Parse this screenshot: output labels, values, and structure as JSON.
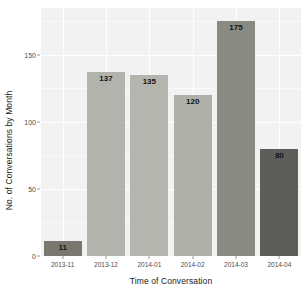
{
  "chart_data": {
    "type": "bar",
    "title": "",
    "subtitle": "",
    "xlabel": "Time of Conversation",
    "ylabel": "No. of Conversations by Month",
    "categories": [
      "2013-11",
      "2013-12",
      "2014-01",
      "2014-02",
      "2014-03",
      "2014-04"
    ],
    "values": [
      11,
      137,
      135,
      120,
      175,
      80
    ],
    "data_labels": [
      "11",
      "137",
      "135",
      "120",
      "175",
      "80"
    ],
    "bar_colors": [
      "#77776f",
      "#b3b3ad",
      "#b5b5af",
      "#b0b0aa",
      "#8a8a84",
      "#5d5d5a"
    ],
    "ylim": [
      0,
      185
    ],
    "y_ticks": [
      0,
      50,
      100,
      150
    ],
    "y_tick_labels": [
      "0",
      "50",
      "100",
      "150"
    ],
    "y_minor_ticks": [
      25,
      75,
      125,
      175
    ],
    "grid": true,
    "legend": "none",
    "panel_background": "#f2f2f2",
    "gridline_color": "#ffffff",
    "text_color": "#1a1a1a",
    "tick_label_color": "#4d4d4d"
  }
}
